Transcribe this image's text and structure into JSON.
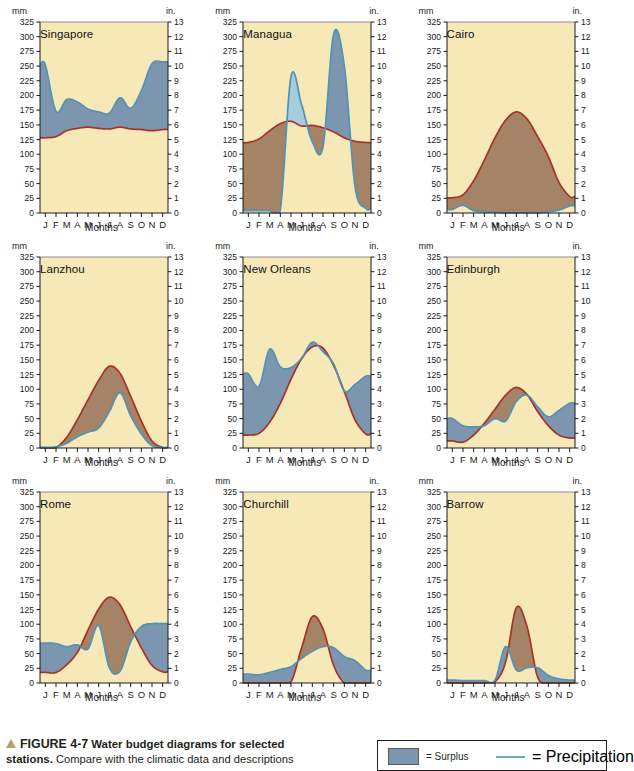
{
  "figure": {
    "caption_marker": "triangle-icon",
    "caption_label": "FIGURE 4-7",
    "caption_title": "Water budget diagrams for selected",
    "caption_title_2": "stations.",
    "caption_rest": " Compare with the climatic data and descriptions"
  },
  "legend": {
    "surplus_label": "= Surplus",
    "precipitation_label": "= Precipitation",
    "surplus_color": "#7d96b0",
    "precipitation_color": "#6aa8c8"
  },
  "colors": {
    "plot_background": "#f7e8b8",
    "surplus": "#7d96b0",
    "deficit": "#9c7a5e",
    "recharge": "#a6cddd",
    "precip_line": "#4f94b4",
    "pe_line": "#a83228",
    "axis": "#1a1a1a"
  },
  "axes": {
    "left_unit": "mm",
    "right_unit": "in.",
    "x_title": "Months",
    "left_ticks": [
      0,
      25,
      50,
      75,
      100,
      125,
      150,
      175,
      200,
      225,
      250,
      275,
      300,
      325
    ],
    "right_ticks": [
      0,
      1,
      2,
      3,
      4,
      5,
      6,
      7,
      8,
      9,
      10,
      11,
      12,
      13
    ],
    "month_labels": [
      "J",
      "F",
      "M",
      "A",
      "M",
      "J",
      "J",
      "A",
      "S",
      "O",
      "N",
      "D"
    ],
    "y_min": 0,
    "y_max": 325
  },
  "chart_data": {
    "type": "area",
    "title": "Water budget diagrams for selected stations",
    "xlabel": "Months",
    "ylabel": "mm",
    "ylabel_right": "in.",
    "ylim": [
      0,
      325
    ],
    "categories": [
      "J",
      "F",
      "M",
      "A",
      "M",
      "J",
      "J",
      "A",
      "S",
      "O",
      "N",
      "D"
    ],
    "legend": [
      "Surplus",
      "Precipitation",
      "Potential evapotranspiration",
      "Deficit",
      "Recharge"
    ],
    "panels": [
      {
        "station": "Singapore",
        "series": [
          {
            "name": "Precipitation",
            "values": [
              252,
              173,
              193,
              189,
              177,
              172,
              170,
              196,
              178,
              208,
              254,
              257
            ]
          },
          {
            "name": "Potential evapotranspiration",
            "values": [
              128,
              130,
              140,
              144,
              146,
              144,
              143,
              146,
              143,
              142,
              140,
              142
            ]
          }
        ]
      },
      {
        "station": "Managua",
        "series": [
          {
            "name": "Precipitation",
            "values": [
              4,
              4,
              4,
              6,
              232,
              184,
              121,
              113,
              305,
              250,
              45,
              8
            ]
          },
          {
            "name": "Potential evapotranspiration",
            "values": [
              120,
              126,
              140,
              152,
              156,
              148,
              149,
              145,
              138,
              128,
              122,
              120
            ]
          }
        ]
      },
      {
        "station": "Cairo",
        "series": [
          {
            "name": "Precipitation",
            "values": [
              6,
              13,
              4,
              2,
              1,
              0,
              0,
              0,
              0,
              2,
              5,
              12
            ]
          },
          {
            "name": "Potential evapotranspiration",
            "values": [
              26,
              31,
              55,
              90,
              128,
              158,
              172,
              160,
              130,
              96,
              52,
              28
            ]
          }
        ]
      },
      {
        "station": "Lanzhou",
        "series": [
          {
            "name": "Precipitation",
            "values": [
              1,
              2,
              8,
              19,
              27,
              34,
              62,
              94,
              55,
              24,
              4,
              1
            ]
          },
          {
            "name": "Potential evapotranspiration",
            "values": [
              0,
              1,
              18,
              48,
              82,
              115,
              139,
              127,
              88,
              46,
              12,
              1
            ]
          }
        ]
      },
      {
        "station": "New Orleans",
        "series": [
          {
            "name": "Precipitation",
            "values": [
              126,
              105,
              168,
              138,
              137,
              153,
              180,
              164,
              143,
              97,
              108,
              122
            ]
          },
          {
            "name": "Potential evapotranspiration",
            "values": [
              22,
              25,
              44,
              76,
              117,
              152,
              172,
              170,
              140,
              96,
              48,
              24
            ]
          }
        ]
      },
      {
        "station": "Edinburgh",
        "series": [
          {
            "name": "Precipitation",
            "values": [
              50,
              38,
              36,
              38,
              50,
              46,
              79,
              90,
              70,
              53,
              64,
              76
            ]
          },
          {
            "name": "Potential evapotranspiration",
            "values": [
              12,
              10,
              22,
              42,
              66,
              90,
              103,
              91,
              62,
              38,
              22,
              17
            ]
          }
        ]
      },
      {
        "station": "Rome",
        "series": [
          {
            "name": "Precipitation",
            "values": [
              68,
              67,
              62,
              65,
              58,
              98,
              26,
              20,
              70,
              96,
              101,
              101
            ]
          },
          {
            "name": "Potential evapotranspiration",
            "values": [
              18,
              18,
              31,
              52,
              90,
              126,
              146,
              133,
              96,
              60,
              30,
              19
            ]
          }
        ]
      },
      {
        "station": "Churchill",
        "series": [
          {
            "name": "Precipitation",
            "values": [
              15,
              14,
              18,
              23,
              28,
              42,
              54,
              62,
              60,
              45,
              38,
              22
            ]
          },
          {
            "name": "Potential evapotranspiration",
            "values": [
              0,
              0,
              0,
              0,
              2,
              60,
              113,
              92,
              30,
              0,
              0,
              0
            ]
          }
        ]
      },
      {
        "station": "Barrow",
        "series": [
          {
            "name": "Precipitation",
            "values": [
              5,
              4,
              4,
              4,
              5,
              62,
              22,
              26,
              26,
              13,
              7,
              5
            ]
          },
          {
            "name": "Potential evapotranspiration",
            "values": [
              0,
              0,
              0,
              0,
              2,
              36,
              128,
              96,
              10,
              0,
              0,
              0
            ]
          }
        ]
      }
    ]
  }
}
